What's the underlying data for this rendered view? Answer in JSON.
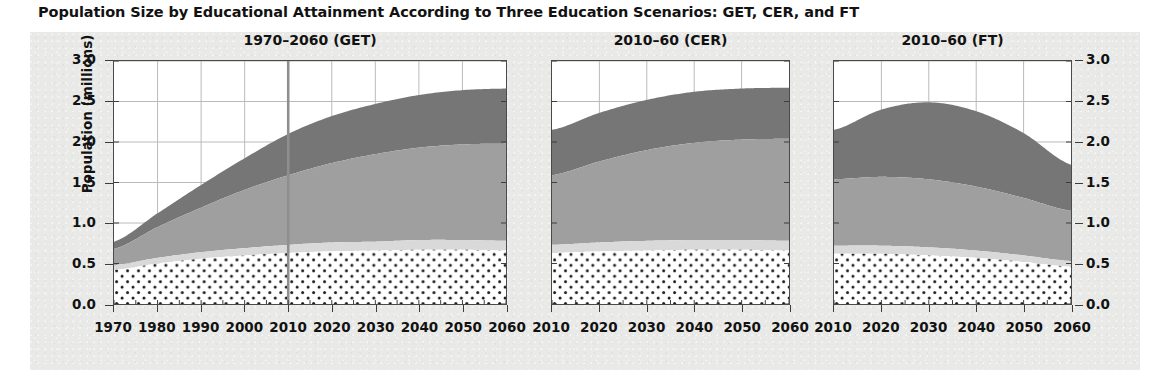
{
  "figure": {
    "title": "Population Size by Educational Attainment According to Three Education Scenarios: GET, CER, and FT",
    "ylabel": "Population (millions)"
  },
  "axis": {
    "yticks": [
      "0.0",
      "0.5",
      "1.0",
      "1.5",
      "2.0",
      "2.5",
      "3.0"
    ],
    "ytick_values": [
      0.0,
      0.5,
      1.0,
      1.5,
      2.0,
      2.5,
      3.0
    ],
    "ylim": [
      0.0,
      3.0
    ]
  },
  "panels": [
    {
      "id": "get",
      "title": "1970–2060 (GET)",
      "xticks": [
        "1970",
        "1980",
        "1990",
        "2000",
        "2010",
        "2020",
        "2030",
        "2040",
        "2050",
        "2060"
      ],
      "xlim": [
        1970,
        2060
      ],
      "reference_line_year": 2010
    },
    {
      "id": "cer",
      "title": "2010–60 (CER)",
      "xticks": [
        "2010",
        "2020",
        "2030",
        "2040",
        "2050",
        "2060"
      ],
      "xlim": [
        2010,
        2060
      ],
      "reference_line_year": null
    },
    {
      "id": "ft",
      "title": "2010–60 (FT)",
      "xticks": [
        "2010",
        "2020",
        "2030",
        "2040",
        "2050",
        "2060"
      ],
      "xlim": [
        2010,
        2060
      ],
      "reference_line_year": null
    }
  ],
  "colors": {
    "layer_no_education": "#ffffff",
    "layer_no_education_dot": "#1a1a1a",
    "layer_primary": "#d9d9d9",
    "layer_secondary": "#9f9f9f",
    "layer_tertiary": "#767676",
    "axis": "#3c3c3c",
    "grid": "#b9b9b9",
    "paper": "#e9e9e7",
    "text": "#121212"
  },
  "chart_data": {
    "type": "area",
    "title": "Population Size by Educational Attainment According to Three Education Scenarios: GET, CER, and FT",
    "xlabel": "",
    "ylabel": "Population (millions)",
    "ylim": [
      0.0,
      3.0
    ],
    "grid": true,
    "legend": "none",
    "stacked": true,
    "layer_order_bottom_to_top": [
      "No education",
      "Primary",
      "Secondary",
      "Tertiary"
    ],
    "panels": [
      {
        "name": "1970–2060 (GET)",
        "x": [
          1970,
          1980,
          1990,
          2000,
          2010,
          2020,
          2030,
          2040,
          2050,
          2060
        ],
        "series": [
          {
            "name": "No education",
            "values": [
              0.42,
              0.5,
              0.56,
              0.6,
              0.63,
              0.65,
              0.66,
              0.67,
              0.67,
              0.66
            ]
          },
          {
            "name": "Primary",
            "values": [
              0.06,
              0.07,
              0.08,
              0.09,
              0.1,
              0.11,
              0.11,
              0.12,
              0.12,
              0.12
            ]
          },
          {
            "name": "Secondary",
            "values": [
              0.2,
              0.38,
              0.55,
              0.72,
              0.86,
              0.98,
              1.08,
              1.14,
              1.18,
              1.2
            ]
          },
          {
            "name": "Tertiary",
            "values": [
              0.09,
              0.17,
              0.28,
              0.39,
              0.51,
              0.58,
              0.62,
              0.65,
              0.67,
              0.68
            ]
          }
        ],
        "totals": [
          0.77,
          1.12,
          1.47,
          1.8,
          2.1,
          2.32,
          2.47,
          2.58,
          2.64,
          2.66
        ]
      },
      {
        "name": "2010–60 (CER)",
        "x": [
          2010,
          2020,
          2030,
          2040,
          2050,
          2060
        ],
        "series": [
          {
            "name": "No education",
            "values": [
              0.63,
              0.65,
              0.66,
              0.67,
              0.67,
              0.66
            ]
          },
          {
            "name": "Primary",
            "values": [
              0.1,
              0.11,
              0.12,
              0.12,
              0.12,
              0.12
            ]
          },
          {
            "name": "Secondary",
            "values": [
              0.86,
              1.0,
              1.12,
              1.2,
              1.24,
              1.26
            ]
          },
          {
            "name": "Tertiary",
            "values": [
              0.56,
              0.6,
              0.62,
              0.63,
              0.63,
              0.63
            ]
          }
        ],
        "totals": [
          2.15,
          2.36,
          2.52,
          2.62,
          2.66,
          2.67
        ]
      },
      {
        "name": "2010–60 (FT)",
        "x": [
          2010,
          2020,
          2030,
          2040,
          2050,
          2060
        ],
        "series": [
          {
            "name": "No education",
            "values": [
              0.62,
              0.62,
              0.6,
              0.57,
              0.52,
              0.46
            ]
          },
          {
            "name": "Primary",
            "values": [
              0.1,
              0.1,
              0.1,
              0.09,
              0.08,
              0.07
            ]
          },
          {
            "name": "Secondary",
            "values": [
              0.82,
              0.85,
              0.84,
              0.79,
              0.71,
              0.62
            ]
          },
          {
            "name": "Tertiary",
            "values": [
              0.61,
              0.83,
              0.95,
              0.93,
              0.8,
              0.57
            ]
          }
        ],
        "totals": [
          2.15,
          2.4,
          2.49,
          2.38,
          2.11,
          1.72
        ]
      }
    ]
  }
}
